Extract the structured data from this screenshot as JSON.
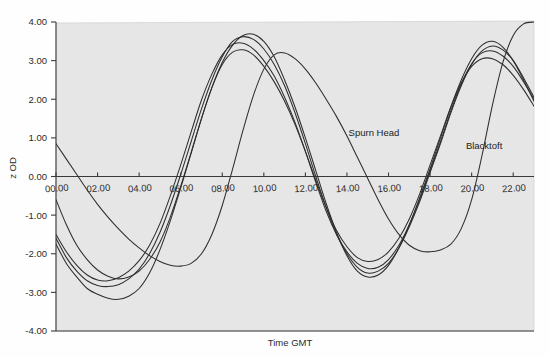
{
  "chart_data": {
    "type": "line",
    "title": "",
    "xlabel": "Time GMT",
    "ylabel": "z OD",
    "xlim": [
      0,
      23
    ],
    "ylim": [
      -4,
      4
    ],
    "grid": false,
    "legend_position": "inline-annotation",
    "x_tick_labels": [
      "00.00",
      "02.00",
      "04.00",
      "06.00",
      "08.00",
      "10.00",
      "12.00",
      "14.00",
      "16.00",
      "18.00",
      "20.00",
      "22.00"
    ],
    "x_tick_values": [
      0,
      2,
      4,
      6,
      8,
      10,
      12,
      14,
      16,
      18,
      20,
      22
    ],
    "y_tick_labels": [
      "4.00",
      "3.00",
      "2.00",
      "1.00",
      "0.00",
      "-1.00",
      "-2.00",
      "-3.00",
      "-4.00"
    ],
    "y_tick_values": [
      4,
      3,
      2,
      1,
      0,
      -1,
      -2,
      -3,
      -4
    ],
    "annotations": [
      {
        "text": "Spurn Head",
        "x": 15.3,
        "y": 1.05
      },
      {
        "text": "Blacktoft",
        "x": 20.6,
        "y": 0.72
      }
    ],
    "series": [
      {
        "name": "Spurn Head",
        "x": [
          0,
          0.5,
          1,
          1.5,
          2,
          2.5,
          3,
          3.5,
          4,
          4.5,
          5,
          5.5,
          6,
          6.5,
          7,
          7.5,
          8,
          8.5,
          9,
          9.5,
          10,
          10.5,
          11,
          11.5,
          12,
          12.5,
          13,
          13.5,
          14,
          14.5,
          15,
          15.5,
          16,
          16.5,
          17,
          17.5,
          18,
          18.5,
          19,
          19.5,
          20,
          20.5,
          21,
          21.5,
          22,
          22.5,
          23
        ],
        "values": [
          -1.75,
          -2.25,
          -2.6,
          -2.9,
          -3.05,
          -3.15,
          -3.18,
          -3.1,
          -2.9,
          -2.5,
          -1.9,
          -1.15,
          -0.3,
          0.6,
          1.5,
          2.3,
          2.95,
          3.4,
          3.65,
          3.68,
          3.5,
          3.1,
          2.5,
          1.8,
          1.0,
          0.15,
          -0.7,
          -1.45,
          -2.05,
          -2.45,
          -2.6,
          -2.55,
          -2.3,
          -1.85,
          -1.25,
          -0.55,
          0.2,
          1.0,
          1.8,
          2.5,
          3.05,
          3.4,
          3.5,
          3.35,
          3.0,
          2.5,
          1.95
        ]
      },
      {
        "name": "Curve 2",
        "x": [
          0,
          0.5,
          1,
          1.5,
          2,
          2.5,
          3,
          3.5,
          4,
          4.5,
          5,
          5.5,
          6,
          6.5,
          7,
          7.5,
          8,
          8.5,
          9,
          9.5,
          10,
          10.5,
          11,
          11.5,
          12,
          12.5,
          13,
          13.5,
          14,
          14.5,
          15,
          15.5,
          16,
          16.5,
          17,
          17.5,
          18,
          18.5,
          19,
          19.5,
          20,
          20.5,
          21,
          21.5,
          22,
          22.5,
          23
        ],
        "values": [
          -1.6,
          -2.1,
          -2.45,
          -2.7,
          -2.82,
          -2.85,
          -2.8,
          -2.65,
          -2.4,
          -2.0,
          -1.45,
          -0.75,
          0.05,
          0.9,
          1.75,
          2.5,
          3.1,
          3.5,
          3.62,
          3.55,
          3.3,
          2.9,
          2.35,
          1.65,
          0.85,
          0.0,
          -0.8,
          -1.5,
          -2.0,
          -2.35,
          -2.5,
          -2.45,
          -2.25,
          -1.85,
          -1.3,
          -0.65,
          0.1,
          0.85,
          1.65,
          2.35,
          2.9,
          3.25,
          3.38,
          3.28,
          3.0,
          2.55,
          2.05
        ]
      },
      {
        "name": "Curve 3",
        "x": [
          0,
          0.5,
          1,
          1.5,
          2,
          2.5,
          3,
          3.5,
          4,
          4.5,
          5,
          5.5,
          6,
          6.5,
          7,
          7.5,
          8,
          8.5,
          9,
          9.5,
          10,
          10.5,
          11,
          11.5,
          12,
          12.5,
          13,
          13.5,
          14,
          14.5,
          15,
          15.5,
          16,
          16.5,
          17,
          17.5,
          18,
          18.5,
          19,
          19.5,
          20,
          20.5,
          21,
          21.5,
          22,
          22.5,
          23
        ],
        "values": [
          -1.5,
          -1.95,
          -2.3,
          -2.55,
          -2.68,
          -2.7,
          -2.62,
          -2.45,
          -2.18,
          -1.78,
          -1.22,
          -0.5,
          0.3,
          1.15,
          1.98,
          2.65,
          3.15,
          3.42,
          3.45,
          3.3,
          3.0,
          2.6,
          2.05,
          1.4,
          0.65,
          -0.15,
          -0.9,
          -1.5,
          -1.95,
          -2.25,
          -2.38,
          -2.35,
          -2.15,
          -1.78,
          -1.25,
          -0.6,
          0.15,
          0.9,
          1.7,
          2.4,
          2.92,
          3.2,
          3.25,
          3.12,
          2.85,
          2.45,
          2.0
        ]
      },
      {
        "name": "Curve 4",
        "x": [
          0,
          0.5,
          1,
          1.5,
          2,
          2.5,
          3,
          3.5,
          4,
          4.5,
          5,
          5.5,
          6,
          6.5,
          7,
          7.5,
          8,
          8.5,
          9,
          9.5,
          10,
          10.5,
          11,
          11.5,
          12,
          12.5,
          13,
          13.5,
          14,
          14.5,
          15,
          15.5,
          16,
          16.5,
          17,
          17.5,
          18,
          18.5,
          19,
          19.5,
          20,
          20.5,
          21,
          21.5,
          22,
          22.5,
          23
        ],
        "values": [
          -0.6,
          -1.25,
          -1.78,
          -2.15,
          -2.42,
          -2.58,
          -2.65,
          -2.6,
          -2.45,
          -2.15,
          -1.7,
          -1.05,
          -0.25,
          0.62,
          1.5,
          2.3,
          2.9,
          3.22,
          3.28,
          3.15,
          2.85,
          2.45,
          1.95,
          1.35,
          0.65,
          -0.1,
          -0.8,
          -1.4,
          -1.82,
          -2.1,
          -2.2,
          -2.15,
          -1.95,
          -1.6,
          -1.1,
          -0.45,
          0.3,
          1.05,
          1.8,
          2.42,
          2.85,
          3.05,
          3.05,
          2.9,
          2.62,
          2.25,
          1.82
        ]
      },
      {
        "name": "Blacktoft",
        "x": [
          0,
          0.5,
          1,
          1.5,
          2,
          2.5,
          3,
          3.5,
          4,
          4.5,
          5,
          5.5,
          6,
          6.5,
          7,
          7.5,
          8,
          8.5,
          9,
          9.5,
          10,
          10.5,
          11,
          11.5,
          12,
          12.5,
          13,
          13.5,
          14,
          14.5,
          15,
          15.5,
          16,
          16.5,
          17,
          17.5,
          18,
          18.5,
          19,
          19.5,
          20,
          20.5,
          21,
          21.5,
          22,
          22.5,
          23
        ],
        "values": [
          0.85,
          0.45,
          0.05,
          -0.35,
          -0.72,
          -1.05,
          -1.35,
          -1.62,
          -1.85,
          -2.05,
          -2.2,
          -2.3,
          -2.32,
          -2.25,
          -2.0,
          -1.5,
          -0.75,
          0.2,
          1.2,
          2.1,
          2.78,
          3.15,
          3.2,
          3.05,
          2.78,
          2.42,
          2.0,
          1.55,
          1.05,
          0.5,
          -0.05,
          -0.6,
          -1.1,
          -1.5,
          -1.78,
          -1.92,
          -1.95,
          -1.9,
          -1.75,
          -1.35,
          -0.6,
          0.55,
          1.85,
          2.95,
          3.65,
          3.95,
          4.0
        ]
      }
    ]
  },
  "axes": {
    "y_axis_title": "z OD",
    "x_axis_title": "Time GMT"
  }
}
